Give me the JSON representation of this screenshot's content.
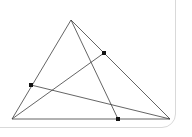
{
  "card": {
    "name": "figure-card",
    "background_color": "#ffffff",
    "border_color": "#d9d9d9",
    "corner_radius_px": 14
  },
  "figure": {
    "stroke_color": "#3d3d3d",
    "point_color": "#141414",
    "stroke_width": 0.8,
    "point_size_px": 4,
    "vertices": [
      {
        "label": "A",
        "role": "apex-vertex",
        "x": 71,
        "y": 20,
        "marked": false
      },
      {
        "label": "B",
        "role": "bottom-left-vertex",
        "x": 12,
        "y": 119,
        "marked": false
      },
      {
        "label": "C",
        "role": "bottom-right-vertex",
        "x": 170,
        "y": 119,
        "marked": false
      }
    ],
    "points": [
      {
        "label": "D",
        "role": "cevian-foot-on-BC",
        "x": 118,
        "y": 119,
        "marked": true
      },
      {
        "label": "E",
        "role": "cevian-foot-on-AC",
        "x": 104,
        "y": 53,
        "marked": true
      },
      {
        "label": "F",
        "role": "cevian-foot-on-AB",
        "x": 31,
        "y": 85,
        "marked": true
      }
    ],
    "segments": [
      {
        "name": "side-AB",
        "from": "A",
        "to": "B",
        "path": "M71,20 L12,119"
      },
      {
        "name": "side-BC",
        "from": "B",
        "to": "C",
        "path": "M12,119 L170,119"
      },
      {
        "name": "side-CA",
        "from": "C",
        "to": "A",
        "path": "M170,119 L71,20"
      },
      {
        "name": "cevian-A-to-D",
        "from": "A",
        "to": "D",
        "path": "M71,20 L118,119"
      },
      {
        "name": "cevian-B-to-E",
        "from": "B",
        "to": "E",
        "path": "M12,119 L104,53"
      },
      {
        "name": "cevian-C-to-F",
        "from": "C",
        "to": "F",
        "path": "M170,119 L31,85"
      }
    ]
  }
}
